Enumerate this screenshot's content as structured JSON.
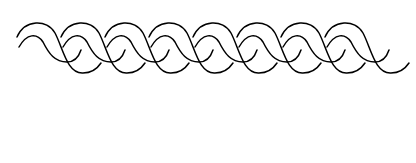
{
  "figure": {
    "stroke_color": "#000000",
    "background_color": "#ffffff",
    "twist_count": 8
  }
}
